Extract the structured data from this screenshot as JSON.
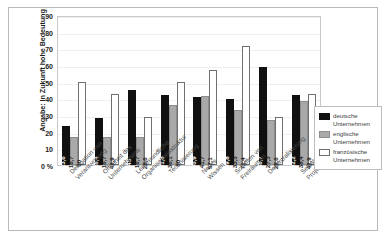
{
  "chart_data": {
    "type": "bar",
    "title": "",
    "xlabel": "",
    "ylabel": "Angabe: In Zukunft hohe Bedeutung",
    "ylim": [
      0,
      90
    ],
    "yticks": [
      "0 %",
      "10",
      "20",
      "30",
      "40",
      "50",
      "60",
      "70",
      "80",
      "90"
    ],
    "grid": true,
    "legend_position": "right",
    "categories": [
      "Delegation von Verantwortung",
      "Offenheit des Unternehmens",
      "Lernfreundliche Organisationsstruktur",
      "Technisierung",
      "Neues Wissen",
      "Schaffen von Freiräumen",
      "Dezentralisierung",
      "Selbstorganisierende Projektgruppen"
    ],
    "series": [
      {
        "name": "deutsche Unternehmen",
        "color": "#101010",
        "values": [
          23.6,
          28.4,
          45,
          41.8,
          40.9,
          39.8,
          58.7,
          42.2
        ],
        "labels": [
          "23,6",
          "28,4",
          "45",
          "41,8",
          "40,9",
          "39,8",
          "58,7",
          "42,2"
        ]
      },
      {
        "name": "englische Unternehmen",
        "color": "#a9a9a9",
        "values": [
          16.7,
          16.7,
          16.7,
          36.1,
          41.7,
          33.3,
          27.3,
          38.4
        ],
        "labels": [
          "16,7",
          "16,7",
          "16,7",
          "36,1",
          "41,7",
          "33,3",
          "27,3",
          "38,4"
        ]
      },
      {
        "name": "französische Unternehmen",
        "color": "#ffffff",
        "values": [
          50,
          42.9,
          28.6,
          50,
          57.1,
          71.4,
          28.6,
          42.9
        ],
        "labels": [
          "50",
          "42,9",
          "28,6",
          "50",
          "57,1",
          "71,4",
          "28,6",
          "42,9"
        ]
      }
    ]
  },
  "legend": {
    "items": [
      {
        "label": "deutsche Unternehmen"
      },
      {
        "label": "englische Unternehmen"
      },
      {
        "label": "französische Unternehmen"
      }
    ]
  }
}
